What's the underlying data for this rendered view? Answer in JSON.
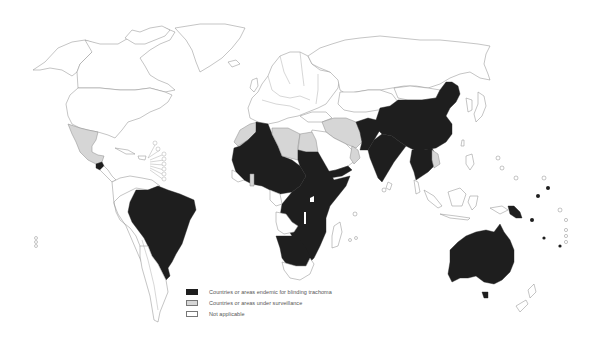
{
  "map": {
    "title": "Global distribution of blinding trachoma",
    "categories": [
      {
        "key": "endemic",
        "color": "#1e1e1e"
      },
      {
        "key": "surveillance",
        "color": "#d6d6d6"
      },
      {
        "key": "not_applicable",
        "color": "#ffffff"
      }
    ],
    "endemic_regions": [
      "Brazil",
      "Guatemala",
      "Sahel and West Africa",
      "Sudan",
      "Ethiopia",
      "East Africa",
      "Southern Africa",
      "Yemen",
      "Pakistan",
      "Afghanistan",
      "India",
      "China",
      "Myanmar",
      "Laos",
      "Cambodia",
      "Vietnam",
      "Papua New Guinea",
      "Australia",
      "Pacific islands"
    ],
    "surveillance_regions": [
      "Mexico",
      "Morocco",
      "Libya",
      "Egypt",
      "Iran",
      "Iraq",
      "Oman",
      "Ghana",
      "Thailand"
    ]
  },
  "legend": {
    "items": [
      {
        "label": "Countries or areas endemic for blinding trachoma",
        "color": "#1e1e1e"
      },
      {
        "label": "Countries or areas under surveillance",
        "color": "#d6d6d6"
      },
      {
        "label": "Not applicable",
        "color": "#ffffff"
      }
    ]
  }
}
